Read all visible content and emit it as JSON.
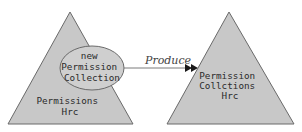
{
  "diagram": {
    "colors": {
      "shape_fill": "#c8c8c8",
      "shape_stroke": "#6a6a6a",
      "ellipse_fill": "#cfcfcf",
      "arrow": "#1a1a1a",
      "text": "#2b2b2b"
    },
    "left_triangle": {
      "label_lines": [
        "Permissions",
        "Hrc"
      ]
    },
    "ellipse": {
      "label_lines": [
        "new",
        "Permission",
        "Collection"
      ]
    },
    "arrow": {
      "label": "Produce"
    },
    "right_triangle": {
      "label_lines": [
        "Permission",
        "Collctions",
        "Hrc"
      ]
    }
  }
}
